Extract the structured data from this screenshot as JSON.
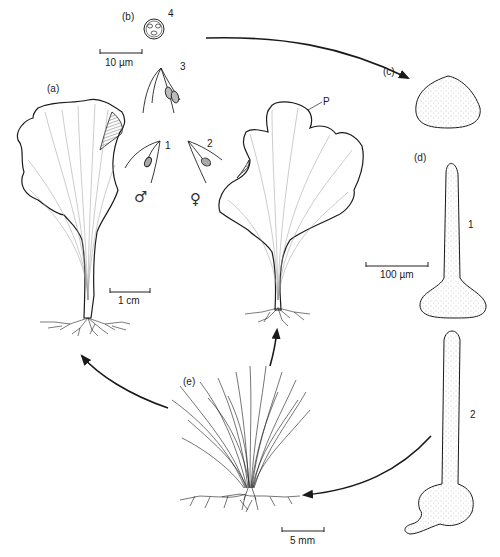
{
  "figure": {
    "panels": {
      "a": {
        "label": "(a)"
      },
      "b": {
        "label": "(b)"
      },
      "c": {
        "label": "(c)"
      },
      "d": {
        "label": "(d)"
      },
      "e": {
        "label": "(e)"
      }
    },
    "stage_numbers": {
      "gamete_male": "1",
      "gamete_female": "2",
      "zygote_fusion": "3",
      "zygote": "4",
      "germling_1": "1",
      "germling_2": "2"
    },
    "symbols": {
      "male": "♂",
      "female": "♀"
    },
    "annotation_p": "P",
    "scale_bars": {
      "gametes": "10 µm",
      "thallus": "1 cm",
      "germlings": "100 µm",
      "filamentous": "5 mm"
    },
    "colors": {
      "line": "#1a1a1a",
      "stipple": "#9a9a9a",
      "background": "#ffffff"
    }
  }
}
